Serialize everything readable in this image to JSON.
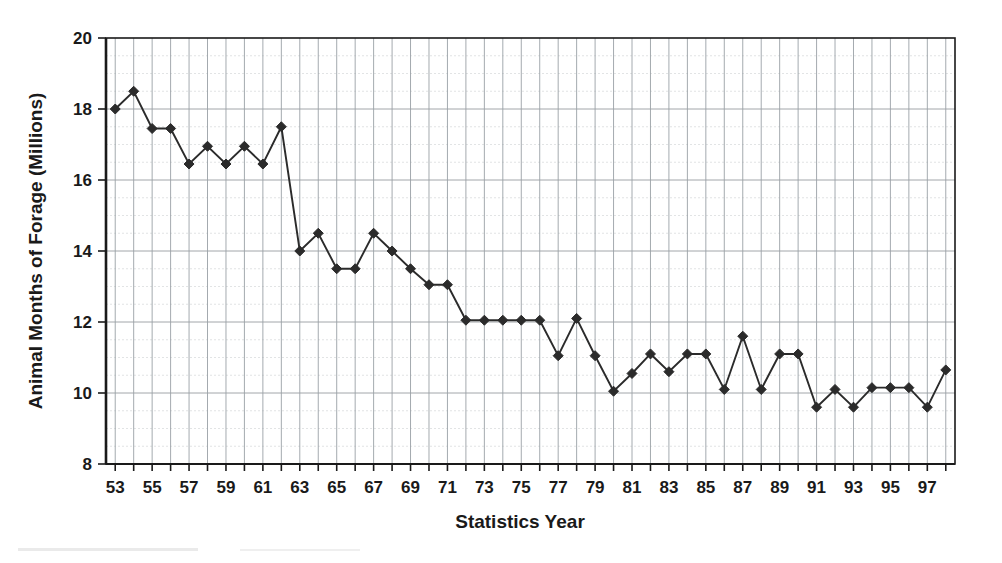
{
  "chart_data": {
    "type": "line",
    "title": "",
    "xlabel": "Statistics Year",
    "ylabel": "Animal Months of Forage (Millions)",
    "xlim": [
      52.5,
      98.5
    ],
    "ylim": [
      8,
      20
    ],
    "grid": true,
    "legend_position": "none",
    "x_tick_labels": [
      "53",
      "55",
      "57",
      "59",
      "61",
      "63",
      "65",
      "67",
      "69",
      "71",
      "73",
      "75",
      "77",
      "79",
      "81",
      "83",
      "85",
      "87",
      "89",
      "91",
      "93",
      "95",
      "97"
    ],
    "y_tick_labels": [
      "8",
      "10",
      "12",
      "14",
      "16",
      "18",
      "20"
    ],
    "y_ticks": [
      8,
      10,
      12,
      14,
      16,
      18,
      20
    ],
    "marker": "diamond",
    "series_name": "Animal Months of Forage",
    "x": [
      53,
      54,
      55,
      56,
      57,
      58,
      59,
      60,
      61,
      62,
      63,
      64,
      65,
      66,
      67,
      68,
      69,
      70,
      71,
      72,
      73,
      74,
      75,
      76,
      77,
      78,
      79,
      80,
      81,
      82,
      83,
      84,
      85,
      86,
      87,
      88,
      89,
      90,
      91,
      92,
      93,
      94,
      95,
      96,
      97,
      98
    ],
    "values": [
      18.0,
      18.5,
      17.45,
      17.45,
      16.45,
      16.95,
      16.45,
      16.95,
      16.45,
      17.5,
      14.0,
      14.5,
      13.5,
      13.5,
      14.5,
      14.0,
      13.5,
      13.05,
      13.05,
      12.05,
      12.05,
      12.05,
      12.05,
      12.05,
      11.05,
      12.1,
      11.05,
      10.05,
      10.55,
      11.1,
      10.6,
      11.1,
      11.1,
      10.1,
      11.6,
      10.1,
      11.1,
      11.1,
      9.6,
      10.1,
      9.6,
      10.15,
      10.15,
      10.15,
      9.6,
      10.65
    ]
  }
}
